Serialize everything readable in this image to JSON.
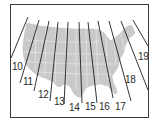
{
  "diagram": {
    "colors": {
      "frame": "#3a3a3a",
      "map_fill": "#c9c9c9",
      "map_borders": "#ededed",
      "zone_lines": "#1e1e1e",
      "label_text": "#2a2a2a",
      "background": "#ffffff"
    },
    "zones": [
      {
        "label": "10",
        "line": [
          [
            28,
            17
          ],
          [
            11,
            58
          ]
        ],
        "label_pos": [
          12,
          62
        ]
      },
      {
        "label": "11",
        "line": [
          [
            39,
            20
          ],
          [
            20,
            83
          ]
        ],
        "label_pos": [
          23,
          77
        ]
      },
      {
        "label": "12",
        "line": [
          [
            49,
            21
          ],
          [
            34,
            91
          ]
        ],
        "label_pos": [
          38,
          90
        ]
      },
      {
        "label": "13",
        "line": [
          [
            58,
            22
          ],
          [
            50,
            101
          ]
        ],
        "label_pos": [
          54,
          97
        ]
      },
      {
        "label": "14",
        "line": [
          [
            68,
            22
          ],
          [
            64,
            104
          ]
        ],
        "label_pos": [
          69,
          103
        ]
      },
      {
        "label": "15",
        "line": [
          [
            79,
            22
          ],
          [
            82,
            103
          ]
        ],
        "label_pos": [
          85,
          102
        ]
      },
      {
        "label": "16",
        "line": [
          [
            88,
            22
          ],
          [
            97,
            103
          ]
        ],
        "label_pos": [
          99,
          102
        ]
      },
      {
        "label": "17",
        "line": [
          [
            98,
            21
          ],
          [
            113,
            98
          ]
        ],
        "label_pos": [
          115,
          102
        ]
      },
      {
        "label": "18",
        "line": [
          [
            109,
            21
          ],
          [
            131,
            101
          ]
        ],
        "label_pos": [
          125,
          75
        ]
      },
      {
        "label": "19",
        "line": [
          [
            121,
            21
          ],
          [
            148,
            90
          ]
        ],
        "label_pos": [
          138,
          52
        ]
      }
    ],
    "extra_line": [
      [
        133,
        20
      ],
      [
        148,
        46
      ]
    ]
  }
}
